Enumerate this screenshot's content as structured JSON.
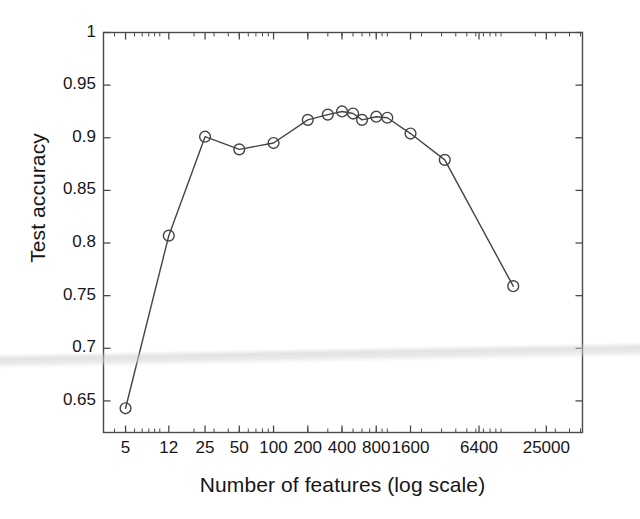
{
  "chart_data": {
    "type": "line",
    "title": "",
    "subtitle": "",
    "xlabel": "Number of features (log scale)",
    "ylabel": "Test accuracy",
    "xscale": "log",
    "xlim": [
      3.2,
      52000
    ],
    "ylim": [
      0.62,
      1.0
    ],
    "grid": false,
    "legend": null,
    "marker": "open-circle",
    "line_color": "#444444",
    "marker_color": "#444444",
    "x_tick_labels": [
      "5",
      "12",
      "25",
      "50",
      "100",
      "200",
      "400",
      "800",
      "1600",
      "6400",
      "25000"
    ],
    "x_tick_values": [
      5,
      12,
      25,
      50,
      100,
      200,
      400,
      800,
      1600,
      6400,
      25000
    ],
    "y_tick_labels": [
      "0.65",
      "0.7",
      "0.75",
      "0.8",
      "0.85",
      "0.9",
      "0.95",
      "1"
    ],
    "y_tick_values": [
      0.65,
      0.7,
      0.75,
      0.8,
      0.85,
      0.9,
      0.95,
      1
    ],
    "series": [
      {
        "name": "Test accuracy",
        "x": [
          5,
          12,
          25,
          50,
          100,
          200,
          300,
          400,
          500,
          600,
          800,
          1000,
          1600,
          3200,
          12800
        ],
        "values": [
          0.643,
          0.807,
          0.901,
          0.889,
          0.895,
          0.917,
          0.922,
          0.925,
          0.923,
          0.917,
          0.92,
          0.919,
          0.904,
          0.879,
          0.759
        ]
      }
    ],
    "annotations": []
  },
  "figure": {
    "axis_color": "#4a4a4a",
    "background": "#ffffff",
    "scan_artifact": "horizontal-light-band"
  }
}
